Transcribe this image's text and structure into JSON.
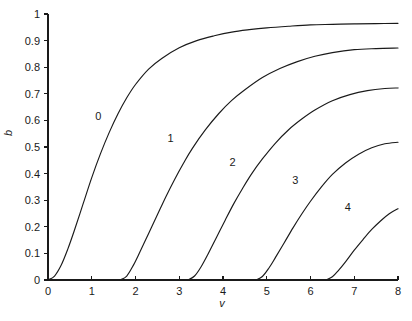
{
  "chart_data": {
    "type": "line",
    "title": "",
    "subtitle": "",
    "xlabel": "v",
    "ylabel": "b",
    "xlim": [
      0,
      8
    ],
    "ylim": [
      0,
      1
    ],
    "grid": false,
    "legend": "inline-curve-labels",
    "xticks": [
      0,
      1,
      2,
      3,
      4,
      5,
      6,
      7,
      8
    ],
    "xticklabels": [
      "0",
      "1",
      "2",
      "3",
      "4",
      "5",
      "6",
      "7",
      "8"
    ],
    "yticks": [
      0,
      0.1,
      0.2,
      0.3,
      0.4,
      0.5,
      0.6,
      0.7,
      0.8,
      0.9,
      1
    ],
    "yticklabels": [
      "0",
      "0.1",
      "0.2",
      "0.3",
      "0.4",
      "0.5",
      "0.6",
      "0.7",
      "0.8",
      "0.9",
      "1"
    ],
    "line_color": "#1a1a1a",
    "background_color": "#ffffff",
    "annotations": [
      {
        "text": "0",
        "x": 1.15,
        "y": 0.615
      },
      {
        "text": "1",
        "x": 2.8,
        "y": 0.535
      },
      {
        "text": "2",
        "x": 4.22,
        "y": 0.445
      },
      {
        "text": "3",
        "x": 5.65,
        "y": 0.375
      },
      {
        "text": "4",
        "x": 6.85,
        "y": 0.275
      }
    ],
    "series": [
      {
        "name": "0",
        "onset": 0.0,
        "endpoint_value": 0.965,
        "x": [
          0.0,
          0.15,
          0.3,
          0.45,
          0.6,
          0.8,
          1.0,
          1.2,
          1.4,
          1.6,
          1.8,
          2.0,
          2.3,
          2.6,
          3.0,
          3.4,
          3.8,
          4.2,
          4.6,
          5.0,
          5.5,
          6.0,
          6.5,
          7.0,
          7.5,
          8.0
        ],
        "y": [
          0.0,
          0.015,
          0.055,
          0.115,
          0.185,
          0.285,
          0.385,
          0.475,
          0.555,
          0.625,
          0.685,
          0.735,
          0.793,
          0.833,
          0.873,
          0.9,
          0.918,
          0.932,
          0.941,
          0.948,
          0.954,
          0.959,
          0.961,
          0.963,
          0.964,
          0.965
        ]
      },
      {
        "name": "1",
        "onset": 1.65,
        "endpoint_value": 0.872,
        "x": [
          1.65,
          1.8,
          1.95,
          2.1,
          2.3,
          2.5,
          2.7,
          2.9,
          3.1,
          3.3,
          3.6,
          3.9,
          4.2,
          4.5,
          4.9,
          5.3,
          5.7,
          6.1,
          6.5,
          7.0,
          7.5,
          8.0
        ],
        "y": [
          0.0,
          0.015,
          0.055,
          0.105,
          0.175,
          0.245,
          0.315,
          0.38,
          0.44,
          0.495,
          0.565,
          0.625,
          0.675,
          0.715,
          0.761,
          0.795,
          0.821,
          0.841,
          0.855,
          0.866,
          0.87,
          0.872
        ]
      },
      {
        "name": "2",
        "onset": 3.2,
        "endpoint_value": 0.722,
        "x": [
          3.2,
          3.35,
          3.5,
          3.65,
          3.85,
          4.05,
          4.25,
          4.45,
          4.65,
          4.9,
          5.2,
          5.5,
          5.8,
          6.1,
          6.5,
          6.9,
          7.3,
          7.7,
          8.0
        ],
        "y": [
          0.0,
          0.015,
          0.05,
          0.095,
          0.16,
          0.225,
          0.288,
          0.345,
          0.398,
          0.455,
          0.515,
          0.565,
          0.605,
          0.639,
          0.674,
          0.697,
          0.712,
          0.72,
          0.722
        ]
      },
      {
        "name": "3",
        "onset": 4.75,
        "endpoint_value": 0.518,
        "x": [
          4.75,
          4.9,
          5.05,
          5.2,
          5.4,
          5.6,
          5.8,
          6.0,
          6.25,
          6.5,
          6.8,
          7.1,
          7.4,
          7.7,
          8.0
        ],
        "y": [
          0.0,
          0.013,
          0.045,
          0.085,
          0.14,
          0.196,
          0.248,
          0.296,
          0.35,
          0.397,
          0.44,
          0.473,
          0.497,
          0.512,
          0.518
        ]
      },
      {
        "name": "4",
        "onset": 6.35,
        "endpoint_value": 0.268,
        "x": [
          6.35,
          6.5,
          6.65,
          6.8,
          7.0,
          7.2,
          7.4,
          7.6,
          7.8,
          8.0
        ],
        "y": [
          0.0,
          0.012,
          0.038,
          0.068,
          0.112,
          0.152,
          0.19,
          0.222,
          0.249,
          0.268
        ]
      }
    ]
  }
}
